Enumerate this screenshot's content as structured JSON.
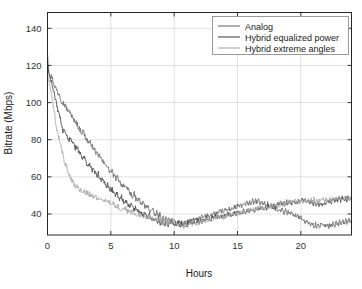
{
  "chart_data": {
    "type": "line",
    "title": "",
    "xlabel": "Hours",
    "ylabel": "Bitrate (Mbps)",
    "xlim": [
      0,
      24
    ],
    "ylim": [
      28.7,
      148.5
    ],
    "xticks": [
      0,
      5,
      10,
      15,
      20
    ],
    "yticks": [
      40,
      60,
      80,
      100,
      120,
      140
    ],
    "xtick_labels": [
      "0",
      "5",
      "10",
      "15",
      "20"
    ],
    "ytick_labels": [
      "40",
      "60",
      "80",
      "100",
      "120",
      "140"
    ],
    "grid": true,
    "legend_position": "top-right",
    "x_step_hours": 0.125,
    "series": [
      {
        "name": "Analog",
        "color": "#6e6e6e",
        "values": [
          127,
          116.5,
          114.2,
          113.8,
          111.0,
          108.4,
          107.1,
          105.2,
          104.8,
          101.9,
          100.3,
          99.4,
          98.2,
          96.4,
          94.8,
          95.6,
          93.0,
          91.2,
          89.8,
          90.4,
          88.1,
          86.0,
          85.2,
          83.8,
          84.6,
          82.0,
          80.3,
          79.2,
          77.9,
          78.6,
          76.1,
          74.8,
          73.9,
          72.2,
          70.8,
          71.6,
          69.2,
          68.0,
          66.8,
          67.4,
          65.1,
          63.8,
          62.6,
          63.4,
          61.0,
          59.8,
          58.9,
          60.2,
          57.6,
          56.4,
          55.2,
          56.0,
          54.1,
          52.8,
          53.6,
          51.4,
          50.2,
          49.4,
          50.8,
          48.1,
          47.2,
          48.4,
          46.0,
          45.2,
          46.4,
          44.1,
          43.2,
          44.6,
          42.0,
          41.4,
          42.8,
          40.2,
          39.4,
          40.8,
          38.6,
          39.8,
          37.4,
          38.6,
          36.8,
          37.9,
          36.2,
          37.4,
          35.6,
          36.8,
          35.0,
          36.2,
          34.4,
          35.8,
          34.0,
          35.4,
          33.6,
          35.0,
          34.2,
          36.0,
          34.8,
          36.4,
          35.2,
          37.0,
          35.8,
          37.6,
          36.4,
          38.2,
          37.0,
          38.8,
          37.4,
          39.2,
          38.0,
          39.8,
          38.4,
          40.2,
          39.0,
          40.8,
          39.4,
          41.2,
          40.0,
          41.8,
          40.4,
          42.2,
          41.0,
          42.8,
          41.4,
          43.2,
          42.0,
          43.8,
          42.4,
          44.2,
          43.0,
          44.8,
          43.4,
          45.2,
          44.0,
          45.8,
          44.4,
          46.2,
          45.0,
          46.8,
          45.4,
          47.0,
          45.8,
          47.2,
          46.0,
          47.4,
          45.6,
          46.8,
          45.0,
          46.2,
          44.4,
          45.6,
          43.8,
          45.0,
          43.2,
          44.4,
          42.6,
          43.8,
          42.0,
          43.2,
          41.4,
          42.6,
          40.8,
          42.0,
          40.2,
          41.4,
          39.6,
          40.8,
          39.0,
          40.2,
          38.4,
          39.6,
          37.8,
          39.0,
          36.2,
          37.4,
          35.0,
          36.2,
          34.4,
          35.6,
          33.8,
          35.0,
          33.2,
          34.6,
          32.8,
          34.2,
          33.4,
          34.8,
          33.0,
          34.4,
          33.6,
          35.0,
          33.2,
          34.6,
          33.8,
          35.2,
          34.0,
          35.6,
          34.2,
          35.8,
          34.6,
          36.2,
          35.0,
          36.6,
          35.4,
          37.0,
          36.0,
          37.6
        ]
      },
      {
        "name": "Hybrid equalized power",
        "color": "#4a4a4a",
        "values": [
          120,
          116.0,
          113.5,
          110.0,
          106.2,
          102.0,
          98.5,
          95.0,
          92.0,
          88.5,
          85.0,
          84.2,
          83.0,
          81.5,
          80.2,
          81.0,
          79.0,
          77.2,
          75.8,
          76.4,
          74.0,
          72.5,
          71.2,
          69.8,
          70.4,
          68.0,
          66.5,
          67.2,
          65.0,
          63.8,
          64.4,
          62.0,
          60.8,
          61.6,
          59.2,
          58.0,
          58.8,
          56.4,
          55.2,
          56.0,
          54.0,
          52.8,
          53.6,
          51.4,
          50.2,
          51.0,
          49.0,
          48.2,
          49.4,
          47.0,
          46.2,
          47.4,
          45.0,
          44.2,
          45.4,
          43.2,
          42.4,
          43.6,
          41.8,
          41.0,
          42.2,
          40.4,
          39.6,
          40.8,
          39.0,
          38.2,
          39.4,
          37.6,
          36.8,
          38.0,
          36.4,
          35.6,
          36.8,
          35.2,
          34.4,
          35.8,
          34.0,
          35.4,
          33.6,
          35.0,
          34.2,
          35.6,
          33.8,
          35.2,
          34.4,
          35.8,
          34.0,
          35.4,
          34.6,
          36.0,
          34.2,
          35.6,
          34.8,
          36.2,
          35.0,
          36.4,
          35.2,
          36.8,
          35.6,
          37.0,
          36.0,
          37.4,
          36.2,
          37.8,
          36.6,
          38.0,
          37.0,
          38.4,
          37.2,
          38.8,
          37.6,
          39.0,
          38.0,
          39.4,
          38.2,
          39.8,
          38.6,
          40.0,
          39.0,
          40.4,
          39.2,
          40.8,
          39.6,
          41.0,
          40.0,
          41.4,
          40.2,
          41.8,
          40.6,
          42.0,
          41.0,
          42.4,
          41.2,
          42.8,
          41.6,
          43.0,
          42.0,
          43.4,
          42.2,
          43.8,
          42.6,
          44.0,
          43.0,
          44.4,
          43.2,
          44.8,
          43.6,
          45.0,
          44.0,
          45.4,
          44.2,
          45.8,
          44.6,
          46.0,
          45.0,
          46.4,
          45.2,
          46.8,
          45.6,
          47.0,
          46.0,
          47.4,
          46.2,
          47.8,
          46.6,
          48.0,
          47.0,
          48.4,
          46.2,
          47.4,
          45.6,
          46.8,
          45.0,
          46.2,
          44.4,
          45.6,
          44.8,
          46.0,
          45.2,
          46.6,
          45.6,
          47.0,
          46.0,
          47.4,
          46.4,
          47.8,
          46.8,
          48.2,
          47.0,
          48.4,
          47.2,
          48.6,
          47.4,
          48.8,
          47.6,
          49.0,
          47.8,
          49.2
        ]
      },
      {
        "name": "Hybrid extreme angles",
        "color": "#a8a8a8",
        "values": [
          116,
          112.0,
          107.5,
          102.0,
          96.5,
          91.0,
          86.0,
          81.5,
          78.0,
          74.5,
          71.0,
          68.0,
          65.5,
          63.0,
          61.0,
          59.0,
          57.5,
          56.0,
          55.0,
          54.2,
          53.5,
          53.0,
          52.6,
          52.2,
          51.8,
          51.4,
          51.0,
          50.6,
          50.2,
          49.8,
          49.4,
          49.0,
          48.6,
          49.2,
          48.0,
          47.4,
          48.2,
          46.8,
          46.2,
          47.0,
          45.6,
          45.0,
          45.8,
          44.4,
          43.8,
          44.6,
          43.2,
          42.6,
          43.4,
          42.0,
          42.8,
          41.4,
          42.2,
          40.8,
          41.6,
          40.2,
          41.0,
          39.6,
          40.4,
          39.0,
          39.8,
          38.4,
          39.2,
          38.0,
          38.8,
          37.6,
          38.4,
          37.2,
          38.0,
          36.8,
          37.6,
          36.4,
          37.2,
          36.0,
          36.8,
          35.6,
          36.4,
          35.2,
          36.0,
          34.8,
          35.6,
          34.4,
          35.2,
          34.0,
          34.8,
          33.6,
          34.4,
          33.2,
          34.0,
          33.6,
          34.4,
          34.0,
          34.8,
          34.4,
          35.2,
          34.8,
          35.6,
          35.2,
          36.0,
          35.6,
          36.4,
          36.0,
          36.8,
          36.4,
          37.2,
          36.8,
          37.6,
          37.2,
          38.0,
          37.6,
          38.4,
          38.0,
          38.8,
          38.4,
          39.2,
          38.8,
          39.6,
          39.2,
          40.0,
          39.6,
          40.4,
          40.0,
          40.8,
          40.4,
          41.2,
          40.8,
          41.6,
          41.2,
          42.0,
          41.6,
          42.4,
          42.0,
          42.8,
          42.4,
          43.2,
          42.8,
          43.6,
          43.0,
          43.8,
          43.2,
          44.0,
          43.4,
          44.2,
          43.6,
          44.6,
          44.0,
          45.0,
          44.4,
          45.4,
          44.8,
          45.8,
          45.2,
          46.2,
          45.6,
          46.6,
          46.0,
          47.0,
          46.2,
          47.2,
          46.4,
          47.4,
          46.0,
          47.0,
          46.2,
          47.2,
          46.6,
          47.6,
          46.8,
          47.8,
          47.0,
          48.0,
          46.6,
          47.6,
          46.8,
          47.8,
          47.0,
          48.2,
          47.2,
          48.4,
          47.0,
          48.2,
          47.4,
          48.6,
          47.2,
          48.4,
          47.6,
          48.8,
          47.4,
          48.6,
          47.8,
          49.0,
          47.6,
          48.8,
          48.0,
          49.2
        ]
      }
    ]
  },
  "legend": {
    "entries": [
      {
        "label": "Analog"
      },
      {
        "label": "Hybrid equalized power"
      },
      {
        "label": "Hybrid extreme angles"
      }
    ]
  },
  "colors": {
    "axis": "#262626",
    "grid": "#d4d4d4",
    "background": "#ffffff",
    "legend_border": "#999999"
  }
}
